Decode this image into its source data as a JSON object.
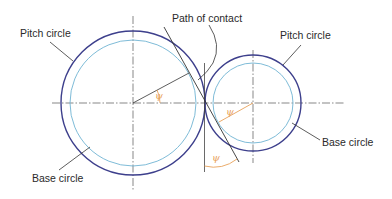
{
  "labels": {
    "pitch_circle_left": "Pitch circle",
    "path_of_contact": "Path of contact",
    "pitch_circle_right": "Pitch circle",
    "base_circle_left": "Base circle",
    "base_circle_right": "Base circle",
    "angle_symbol": "ψ"
  },
  "colors": {
    "pitch_circle": "#3d3f8c",
    "base_circle": "#6fb3d2",
    "lines": "#333333",
    "angle": "#e8a25a",
    "centerline": "#555555"
  },
  "geometry": {
    "gear_left": {
      "cx": 133,
      "cy": 103,
      "pitch_r": 72,
      "base_r": 63
    },
    "gear_right": {
      "cx": 253,
      "cy": 103,
      "pitch_r": 48,
      "base_r": 40
    },
    "pitch_point": {
      "x": 205,
      "y": 103
    }
  }
}
